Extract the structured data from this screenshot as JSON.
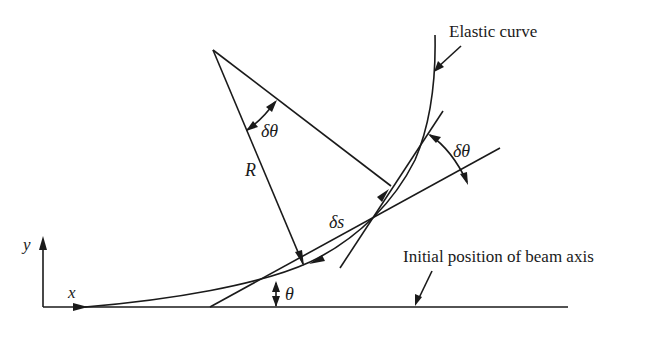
{
  "diagram": {
    "type": "beam-deflection-geometry",
    "labels": {
      "elastic_curve": "Elastic curve",
      "initial_axis": "Initial position of beam axis",
      "radius": "R",
      "arc_length": "δs",
      "delta_theta_center": "δθ",
      "delta_theta_tangent": "δθ",
      "theta": "θ",
      "x_axis": "x",
      "y_axis": "y"
    },
    "colors": {
      "stroke": "#1a1a1a",
      "background": "#ffffff"
    }
  }
}
